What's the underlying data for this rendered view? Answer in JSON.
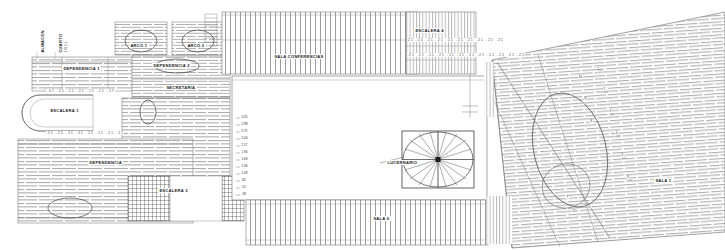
{
  "drawing": {
    "title": "Planta arquitectonica",
    "background_color": "#ffffff",
    "line_color": "#555555",
    "text_color": "#1a1a1a"
  },
  "labels": {
    "almacen": "ALMACEN",
    "cuarto": "CUARTO",
    "cuarto_sub": "1 N 2 L",
    "dependencia_1": "DEPENDENCIA 1",
    "dependencia_2": "DEPENDENCIA 2",
    "dependencia_3": "DEPENDENCIA",
    "arco_1": "ARCO 1",
    "arco_2": "ARCO 2",
    "secretaria": "SECRETARIA",
    "escalera_1": "ESCALERA 1",
    "escalera_3": "ESCALERA 3",
    "escalera_4": "ESCALERA 4",
    "sala_conferencias": "SALA CONFERENCIAS",
    "sala_6": "SALA 6",
    "sala_1": "SALA 1",
    "lucernario": "LUCERNARIO"
  },
  "dimension_strings": {
    "stair1_top": "1.07  .21  .21  .21  .21  .21  .17",
    "stair1_bottom": ".21  .21  .21  .21  .21  .21  .21  .21",
    "escalera4_row1": "21 .21 .21 .21 .21 .21  .21   .21   .21   .21",
    "escalera4_row2": ".21 .21 .21 .21 .21 .21 .21 .21 .21 .21 .21 .21"
  },
  "vertical_scale": {
    "values": [
      "3.25",
      "2.98",
      "2.71",
      "2.44",
      "2.17",
      "1.90",
      "1.63",
      "1.36",
      "1.09",
      ".82",
      ".55",
      ".28"
    ]
  },
  "right_markers": {
    "values": [
      "1",
      "2",
      "3",
      "4",
      "5",
      "6",
      "7",
      "8",
      "9",
      "10",
      "11"
    ]
  },
  "hatch_zones": [
    {
      "name": "zona-superior-izquierda",
      "pattern": "brick-horizontal"
    },
    {
      "name": "zona-arcos",
      "pattern": "brick-horizontal"
    },
    {
      "name": "sala-conferencias",
      "pattern": "vertical-dense"
    },
    {
      "name": "zona-escalera-4",
      "pattern": "vertical-dense"
    },
    {
      "name": "zona-inferior-izquierda",
      "pattern": "brick-horizontal"
    },
    {
      "name": "zona-escalera-3",
      "pattern": "cross-grid"
    },
    {
      "name": "zona-sala-6",
      "pattern": "vertical-dense"
    },
    {
      "name": "zona-derecha-inclinada",
      "pattern": "brick-horizontal-skew"
    }
  ]
}
